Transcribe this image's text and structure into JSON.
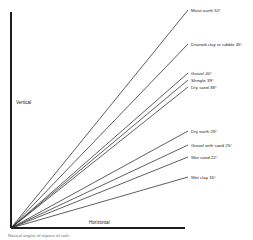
{
  "chart_data": {
    "type": "line",
    "title": "",
    "xlabel": "Horizontal",
    "ylabel": "Vertical",
    "angle_reference": "degrees from vertical axis",
    "origin": {
      "x": 11,
      "y": 228
    },
    "axis": {
      "vertical_top_y": 12,
      "horizontal_right_x": 185
    },
    "series": [
      {
        "name": "Moist earth",
        "angle": 52,
        "label": "Moist earth 52°",
        "end_x": 188,
        "end_y": 10,
        "label_x": 191,
        "label_y": 10
      },
      {
        "name": "Drained clay or rubble",
        "angle": 45,
        "label": "Drained clay or rubble 45°",
        "end_x": 188,
        "end_y": 44,
        "label_x": 191,
        "label_y": 44
      },
      {
        "name": "Gravel",
        "angle": 40,
        "label": "Gravel 40°",
        "end_x": 188,
        "end_y": 73,
        "label_x": 191,
        "label_y": 73
      },
      {
        "name": "Shingle",
        "angle": 39,
        "label": "Shingle 39°",
        "end_x": 188,
        "end_y": 80,
        "label_x": 191,
        "label_y": 80
      },
      {
        "name": "Dry sand",
        "angle": 38,
        "label": "Dry sand 38°",
        "end_x": 188,
        "end_y": 87,
        "label_x": 191,
        "label_y": 87
      },
      {
        "name": "Dry earth",
        "angle": 28,
        "label": "Dry earth 28°",
        "end_x": 188,
        "end_y": 131,
        "label_x": 191,
        "label_y": 131
      },
      {
        "name": "Gravel with sand",
        "angle": 25,
        "label": "Gravel with sand 25°",
        "end_x": 188,
        "end_y": 145,
        "label_x": 191,
        "label_y": 145
      },
      {
        "name": "Wet sand",
        "angle": 22,
        "label": "Wet sand 22°",
        "end_x": 188,
        "end_y": 157,
        "label_x": 191,
        "label_y": 157
      },
      {
        "name": "Wet clay",
        "angle": 16,
        "label": "Wet clay 16°",
        "end_x": 188,
        "end_y": 177,
        "label_x": 191,
        "label_y": 177
      }
    ]
  },
  "axes": {
    "vertical": {
      "label": "Vertical",
      "x": 16,
      "y": 104
    },
    "horizontal": {
      "label": "Horizontal",
      "x": 89,
      "y": 224
    }
  },
  "caption": {
    "text": "Natural angles of repose of soils",
    "x": 8,
    "y": 237
  }
}
